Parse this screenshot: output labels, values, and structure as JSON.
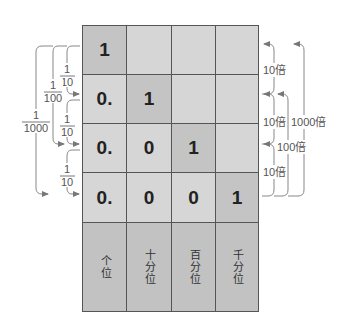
{
  "grid": {
    "rows": [
      [
        "1",
        "",
        "",
        ""
      ],
      [
        "0.",
        "1",
        "",
        ""
      ],
      [
        "0.",
        "0",
        "1",
        ""
      ],
      [
        "0.",
        "0",
        "0",
        "1"
      ]
    ],
    "place_labels": [
      "个位",
      "十分位",
      "百分位",
      "千分位"
    ]
  },
  "left_annotations": {
    "tenth_1": {
      "num": "1",
      "den": "10"
    },
    "tenth_2": {
      "num": "1",
      "den": "10"
    },
    "tenth_3": {
      "num": "1",
      "den": "10"
    },
    "hundredth": {
      "num": "1",
      "den": "100"
    },
    "thousandth": {
      "num": "1",
      "den": "1000"
    }
  },
  "right_annotations": {
    "times10_1": "10倍",
    "times10_2": "10倍",
    "times10_3": "10倍",
    "times100": "100倍",
    "times1000": "1000倍"
  },
  "colors": {
    "cell": "#d6d6d6",
    "highlight_cell": "#c4c4c4",
    "header": "#c2c2c2",
    "grid_line": "#555555",
    "arrow": "#777777"
  }
}
